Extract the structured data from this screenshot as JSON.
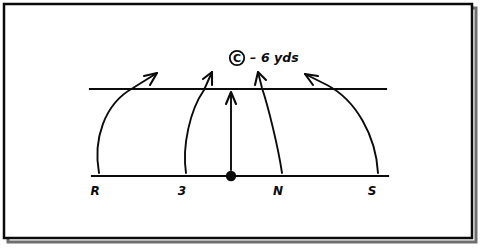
{
  "figure": {
    "kind": "play-diagram",
    "background_color": "#ffffff",
    "ink_color": "#0b0b0b",
    "frame": {
      "name": "outer-border",
      "x": 4,
      "y": 4,
      "width": 468,
      "height": 234,
      "stroke_width": 2.5,
      "shadow_color": "#6f6f6f"
    },
    "annotation": {
      "coverage_symbol": "C",
      "separator": "–",
      "distance_text": "6 yds",
      "full_text": "Ⓒ – 6 yds",
      "x": 240,
      "y": 62
    },
    "lines": [
      {
        "name": "line-of-scrimmage",
        "role": "upper-horizontal-line",
        "x1": 90,
        "y1": 89,
        "x2": 386,
        "y2": 89,
        "stroke_width": 2.2
      },
      {
        "name": "backfield-line",
        "role": "lower-horizontal-line",
        "x1": 92,
        "y1": 176,
        "x2": 388,
        "y2": 176,
        "stroke_width": 2.2
      }
    ],
    "ball_marker": {
      "name": "ball-dot",
      "cx": 231,
      "cy": 176,
      "r": 5.2
    },
    "positions": [
      {
        "key": "R",
        "label": "R",
        "label_x": 95,
        "label_y": 195,
        "start_x": 99,
        "start_y": 172
      },
      {
        "key": "3",
        "label": "3",
        "label_x": 182,
        "label_y": 195,
        "start_x": 186,
        "start_y": 172
      },
      {
        "key": "C",
        "label": "",
        "label_x": 231,
        "label_y": 195,
        "start_x": 231,
        "start_y": 170
      },
      {
        "key": "N",
        "label": "N",
        "label_x": 278,
        "label_y": 195,
        "start_x": 282,
        "start_y": 172
      },
      {
        "key": "S",
        "label": "S",
        "label_x": 372,
        "label_y": 195,
        "start_x": 378,
        "start_y": 172
      }
    ],
    "routes": [
      {
        "name": "route-R",
        "from": "R",
        "path": "M 99 173 C 93 140 104 104 133 88 L 157 73",
        "arrow_tip": {
          "x": 157,
          "y": 73
        },
        "arrow_angle_deg": -33
      },
      {
        "name": "route-3",
        "from": "3",
        "path": "M 186 173 C 182 146 190 110 204 90 L 212 72",
        "arrow_tip": {
          "x": 212,
          "y": 72
        },
        "arrow_angle_deg": -66
      },
      {
        "name": "route-C",
        "from": "C",
        "path": "M 231 170 L 231 94",
        "arrow_tip": {
          "x": 231,
          "y": 92
        },
        "arrow_angle_deg": -90
      },
      {
        "name": "route-N",
        "from": "N",
        "path": "M 282 173 C 278 146 268 106 262 88 L 258 72",
        "arrow_tip": {
          "x": 258,
          "y": 72
        },
        "arrow_angle_deg": -104
      },
      {
        "name": "route-S",
        "from": "S",
        "path": "M 378 173 C 376 136 356 100 327 85 L 305 74",
        "arrow_tip": {
          "x": 305,
          "y": 74
        },
        "arrow_angle_deg": -154
      }
    ]
  }
}
